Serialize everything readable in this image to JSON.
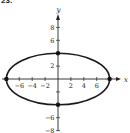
{
  "problem_label": "23.",
  "chart_data": {
    "type": "line",
    "title": "",
    "equation": "x^2/64 + y^2/16 = 1",
    "xlabel": "x",
    "ylabel": "y",
    "xlim": [
      -8.5,
      9
    ],
    "ylim": [
      -9,
      10
    ],
    "grid": false,
    "x_ticks": [
      -6,
      -4,
      -2,
      2,
      4,
      6
    ],
    "x_tick_labels": [
      "-6",
      "-4",
      "-2",
      "2",
      "4",
      "6"
    ],
    "y_ticks": [
      8,
      6,
      2,
      -6,
      -8
    ],
    "y_tick_labels": [
      "8",
      "6",
      "2",
      "-6",
      "-8"
    ],
    "series": [
      {
        "name": "ellipse",
        "center": [
          0,
          0
        ],
        "semi_major_x": 8,
        "semi_minor_y": 4
      }
    ],
    "marked_points": [
      {
        "x": -8,
        "y": 0
      },
      {
        "x": 8,
        "y": 0
      },
      {
        "x": 0,
        "y": 4
      },
      {
        "x": 0,
        "y": -4
      }
    ]
  }
}
